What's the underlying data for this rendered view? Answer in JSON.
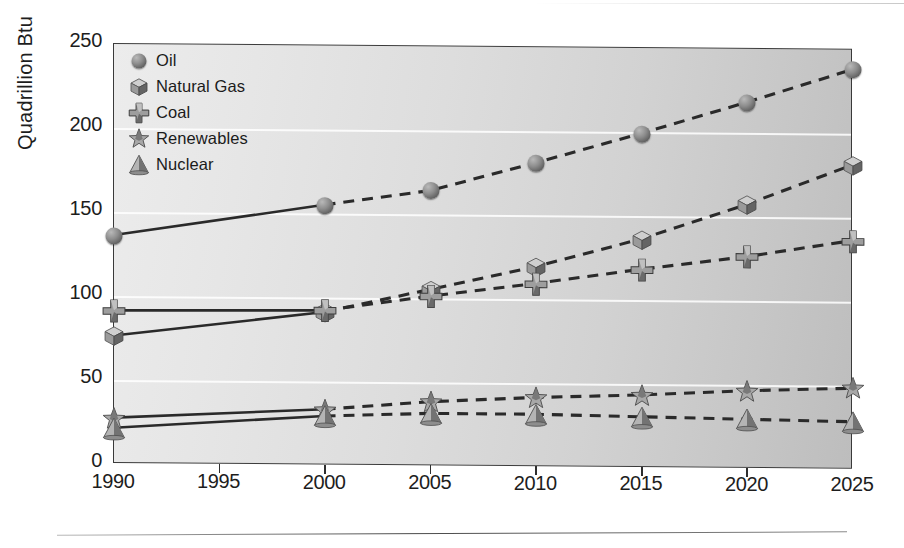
{
  "chart_data": {
    "type": "line",
    "title": "",
    "xlabel": "",
    "ylabel": "Quadrillion Btu",
    "x": [
      1990,
      2000,
      2005,
      2010,
      2015,
      2020,
      2025
    ],
    "xtick_labels": [
      "1990",
      "1995",
      "2000",
      "2005",
      "2010",
      "2015",
      "2020",
      "2025"
    ],
    "xtick_values": [
      1990,
      1995,
      2000,
      2005,
      2010,
      2015,
      2020,
      2025
    ],
    "xlim": [
      1990,
      2025
    ],
    "ytick_labels": [
      "0",
      "50",
      "100",
      "150",
      "200",
      "250"
    ],
    "ytick_values": [
      0,
      50,
      100,
      150,
      200,
      250
    ],
    "ylim": [
      0,
      250
    ],
    "grid": "horizontal-white-gridlines",
    "legend_position": "top-left-inside",
    "history_break_year": 2000,
    "line_style_note": "solid 1990-2000 (historical), dashed 2000-2025 (projected)",
    "series": [
      {
        "name": "Oil",
        "marker": "sphere",
        "color": "#6e6e6e",
        "values": [
          136,
          155,
          164,
          181,
          199,
          218,
          238
        ]
      },
      {
        "name": "Natural Gas",
        "marker": "cube",
        "color": "#8a8a8a",
        "values": [
          76,
          91,
          105,
          119,
          136,
          157,
          181
        ]
      },
      {
        "name": "Coal",
        "marker": "cross",
        "color": "#6a6a6a",
        "values": [
          91,
          92,
          101,
          109,
          118,
          126,
          136
        ]
      },
      {
        "name": "Renewables",
        "marker": "star",
        "color": "#7d7d7d",
        "values": [
          27,
          33,
          38,
          41,
          43,
          46,
          48
        ]
      },
      {
        "name": "Nuclear",
        "marker": "cone",
        "color": "#9a9a9a",
        "values": [
          21,
          29,
          31,
          31,
          30,
          29,
          28
        ]
      }
    ]
  },
  "legend": {
    "items": [
      {
        "label": "Oil",
        "marker": "sphere-icon"
      },
      {
        "label": "Natural Gas",
        "marker": "cube-icon"
      },
      {
        "label": "Coal",
        "marker": "cross-icon"
      },
      {
        "label": "Renewables",
        "marker": "star-icon"
      },
      {
        "label": "Nuclear",
        "marker": "cone-icon"
      }
    ]
  },
  "colors": {
    "axis": "#2e2e2e",
    "text": "#1d1d1d",
    "gridline": "#ffffff",
    "plot_bg_light": "#ececec",
    "plot_bg_dark": "#bdbdbd",
    "line": "#2a2a2a"
  }
}
